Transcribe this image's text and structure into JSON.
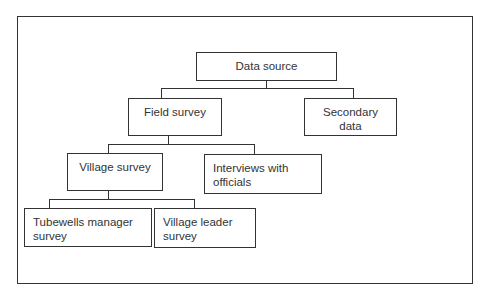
{
  "diagram": {
    "type": "hierarchy-tree",
    "nodes": {
      "root": {
        "label": "Data source"
      },
      "field": {
        "label": "Field survey"
      },
      "secondary": {
        "label_lines": [
          "Secondary",
          "data"
        ]
      },
      "village": {
        "label": "Village survey"
      },
      "interviews": {
        "label_lines": [
          "Interviews with",
          "officials"
        ]
      },
      "tubewells": {
        "label_lines": [
          "Tubewells manager",
          "survey"
        ]
      },
      "leader": {
        "label_lines": [
          "Village leader",
          "survey"
        ]
      }
    },
    "edges": [
      [
        "Data source",
        "Field survey"
      ],
      [
        "Data source",
        "Secondary data"
      ],
      [
        "Field survey",
        "Village survey"
      ],
      [
        "Field survey",
        "Interviews with officials"
      ],
      [
        "Village survey",
        "Tubewells manager survey"
      ],
      [
        "Village survey",
        "Village leader survey"
      ]
    ]
  }
}
